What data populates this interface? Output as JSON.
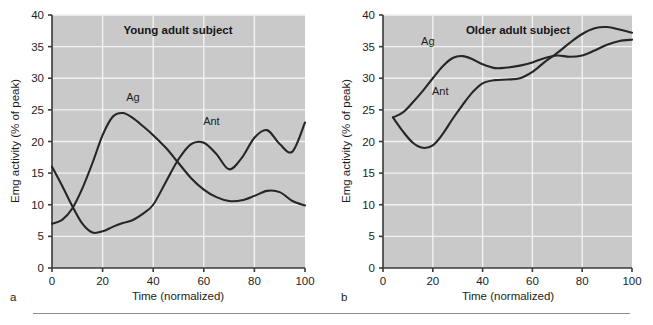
{
  "figure": {
    "panels": [
      {
        "letter": "a",
        "title": "Young adult subject",
        "xlabel": "Time (normalized)",
        "ylabel": "Emg activity (% of peak)",
        "series_labels": {
          "ag": "Ag",
          "ant": "Ant"
        }
      },
      {
        "letter": "b",
        "title": "Older adult subject",
        "xlabel": "Time (normalized)",
        "ylabel": "Emg activity (% of peak)",
        "series_labels": {
          "ag": "Ag",
          "ant": "Ant"
        }
      }
    ],
    "colors": {
      "plot_background": "#c9c9c9",
      "gridline": "#f2f2f2",
      "axis": "#3a3a3a",
      "curve": "#262626",
      "page_background": "#ffffff"
    }
  },
  "chart_data": [
    {
      "type": "line",
      "title": "Young adult subject",
      "panel_letter": "a",
      "xlabel": "Time (normalized)",
      "ylabel": "Emg activity (% of peak)",
      "xlim": [
        0,
        100
      ],
      "ylim": [
        0,
        40
      ],
      "xticks": [
        0,
        20,
        40,
        60,
        80,
        100
      ],
      "yticks": [
        0,
        5,
        10,
        15,
        20,
        25,
        30,
        35,
        40
      ],
      "xtick_labels": [
        "0",
        "20",
        "40",
        "60",
        "80",
        "100"
      ],
      "ytick_labels": [
        "0",
        "5",
        "10",
        "15",
        "20",
        "25",
        "30",
        "35",
        "40"
      ],
      "grid": true,
      "legend": "inline-labels",
      "series": [
        {
          "name": "Ag",
          "label_position": {
            "x": 32,
            "y": 26.4
          },
          "x": [
            0,
            4,
            8,
            12,
            16,
            20,
            24,
            28,
            32,
            36,
            40,
            45,
            50,
            55,
            60,
            65,
            70,
            75,
            80,
            85,
            90,
            95,
            100
          ],
          "values": [
            7.0,
            7.6,
            9.4,
            12.6,
            16.6,
            21.0,
            23.9,
            24.5,
            23.7,
            22.4,
            21.0,
            19.0,
            16.6,
            14.2,
            12.4,
            11.2,
            10.6,
            10.7,
            11.4,
            12.2,
            12.0,
            10.6,
            9.9
          ]
        },
        {
          "name": "Ant",
          "label_position": {
            "x": 63,
            "y": 22.6
          },
          "x": [
            0,
            4,
            8,
            12,
            16,
            20,
            24,
            28,
            32,
            36,
            40,
            45,
            50,
            55,
            60,
            65,
            70,
            75,
            80,
            85,
            90,
            95,
            100
          ],
          "values": [
            16.0,
            13.0,
            9.8,
            7.0,
            5.6,
            5.8,
            6.5,
            7.1,
            7.6,
            8.6,
            10.0,
            13.6,
            17.2,
            19.6,
            19.8,
            18.0,
            15.6,
            17.4,
            20.6,
            21.8,
            19.6,
            18.4,
            23.0
          ]
        }
      ]
    },
    {
      "type": "line",
      "title": "Older adult subject",
      "panel_letter": "b",
      "xlabel": "Time (normalized)",
      "ylabel": "Emg activity (% of peak)",
      "xlim": [
        0,
        100
      ],
      "ylim": [
        0,
        40
      ],
      "xticks": [
        0,
        20,
        40,
        60,
        80,
        100
      ],
      "yticks": [
        0,
        5,
        10,
        15,
        20,
        25,
        30,
        35,
        40
      ],
      "xtick_labels": [
        "0",
        "20",
        "40",
        "60",
        "80",
        "100"
      ],
      "ytick_labels": [
        "0",
        "5",
        "10",
        "15",
        "20",
        "25",
        "30",
        "35",
        "40"
      ],
      "grid": true,
      "legend": "inline-labels",
      "series": [
        {
          "name": "Ag",
          "label_position": {
            "x": 18,
            "y": 35.2
          },
          "x": [
            4,
            8,
            12,
            16,
            20,
            24,
            28,
            32,
            36,
            40,
            45,
            50,
            55,
            60,
            65,
            70,
            75,
            80,
            85,
            90,
            95,
            100
          ],
          "values": [
            23.8,
            24.6,
            26.2,
            28.0,
            30.0,
            31.9,
            33.2,
            33.5,
            33.0,
            32.2,
            31.6,
            31.7,
            32.0,
            32.5,
            33.2,
            33.6,
            33.4,
            33.6,
            34.4,
            35.3,
            35.9,
            36.1
          ]
        },
        {
          "name": "Ant",
          "label_position": {
            "x": 23,
            "y": 27.3
          },
          "x": [
            4,
            8,
            12,
            16,
            20,
            24,
            28,
            32,
            36,
            40,
            45,
            50,
            55,
            60,
            65,
            70,
            75,
            80,
            85,
            90,
            95,
            100
          ],
          "values": [
            23.8,
            21.6,
            19.8,
            19.0,
            19.4,
            21.2,
            23.6,
            25.8,
            27.8,
            29.2,
            29.7,
            29.8,
            30.0,
            31.0,
            32.6,
            34.0,
            35.6,
            37.0,
            37.9,
            38.1,
            37.7,
            37.2
          ]
        }
      ]
    }
  ]
}
